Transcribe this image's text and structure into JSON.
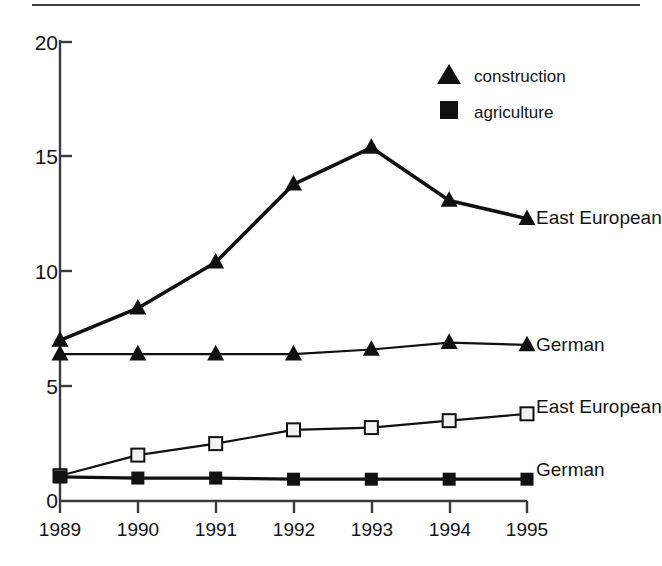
{
  "chart_data": {
    "type": "line",
    "title": "",
    "xlabel": "",
    "ylabel": "",
    "categories": [
      "1989",
      "1990",
      "1991",
      "1992",
      "1993",
      "1994",
      "1995"
    ],
    "x": [
      1989,
      1990,
      1991,
      1992,
      1993,
      1994,
      1995
    ],
    "ylim": [
      0,
      20
    ],
    "xlim": [
      1989,
      1995
    ],
    "yticks": [
      "0",
      "5",
      "10",
      "15",
      "20"
    ],
    "ytick_values": [
      0,
      5,
      10,
      15,
      20
    ],
    "grid": false,
    "legend_position": "top-right",
    "legend": [
      {
        "label": "construction",
        "marker": "filled-triangle"
      },
      {
        "label": "agriculture",
        "marker": "filled-square"
      }
    ],
    "series": [
      {
        "name": "East European",
        "group": "construction",
        "marker": "filled-triangle",
        "end_label": "East European",
        "values": [
          7.0,
          8.4,
          10.4,
          13.8,
          15.4,
          13.1,
          12.3
        ]
      },
      {
        "name": "German",
        "group": "construction",
        "marker": "filled-triangle",
        "end_label": "German",
        "values": [
          6.4,
          6.4,
          6.4,
          6.4,
          6.6,
          6.9,
          6.8
        ]
      },
      {
        "name": "East European",
        "group": "agriculture",
        "marker": "open-square",
        "end_label": "East European",
        "values": [
          1.1,
          2.0,
          2.5,
          3.1,
          3.2,
          3.5,
          3.8
        ]
      },
      {
        "name": "German",
        "group": "agriculture",
        "marker": "filled-square",
        "end_label": "German",
        "values": [
          1.05,
          1.0,
          1.0,
          0.95,
          0.95,
          0.95,
          0.95
        ]
      }
    ],
    "colors": {
      "ink": "#111111",
      "axis": "#3b3b3b",
      "background": "#ffffff"
    }
  },
  "axis": {
    "ytick_labels": [
      "20",
      "15",
      "10",
      "5",
      "0"
    ],
    "xtick_labels": [
      "1989",
      "1990",
      "1991",
      "1992",
      "1993",
      "1994",
      "1995"
    ]
  },
  "legend": {
    "construction": "construction",
    "agriculture": "agriculture"
  },
  "series_labels": {
    "construction_east_european": "East European",
    "construction_german": "German",
    "agriculture_east_european": "East European",
    "agriculture_german": "German"
  }
}
